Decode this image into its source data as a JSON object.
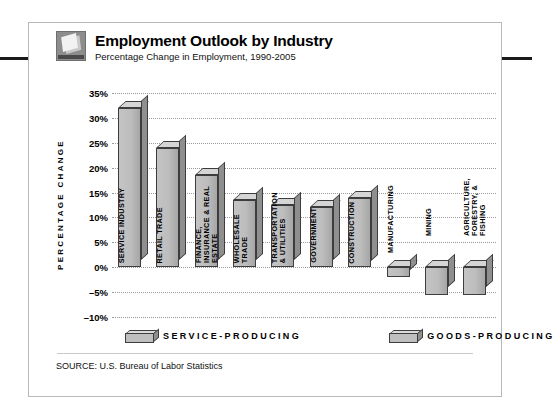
{
  "header": {
    "title": "Employment Outlook by Industry",
    "subtitle": "Percentage Change in Employment, 1990-2005",
    "logo_icon": "cube-box-icon"
  },
  "legend": {
    "items": [
      {
        "label": "SERVICE-PRODUCING",
        "color": "#bfbfbf"
      },
      {
        "label": "GOODS-PRODUCING",
        "color": "#bfbfbf"
      }
    ]
  },
  "source": "SOURCE: U.S. Bureau of Labor Statistics",
  "chart_data": {
    "type": "bar",
    "title": "Employment Outlook by Industry",
    "subtitle": "Percentage Change in Employment, 1990-2005",
    "xlabel": "",
    "ylabel": "PERCENTAGE CHANGE",
    "ylim": [
      -10,
      35
    ],
    "ytick_labels": [
      "35%",
      "30%",
      "25%",
      "20%",
      "15%",
      "10%",
      "5%",
      "0%",
      "–5%",
      "–10%"
    ],
    "yticks": [
      35,
      30,
      25,
      20,
      15,
      10,
      5,
      0,
      -5,
      -10
    ],
    "grid": true,
    "legend_position": "bottom",
    "categories": [
      "SERVICE INDUSTRY",
      "RETAIL TRADE",
      "FINANCE, INSURANCE & REAL ESTATE",
      "WHOLESALE TRADE",
      "TRANSPORTATION & UTILITIES",
      "GOVERNMENT",
      "CONSTRUCTION",
      "MANUFACTURING",
      "MINING",
      "AGRICULTURE, FORESTRY, & FISHING"
    ],
    "values": [
      32,
      24,
      18.5,
      13.5,
      12.5,
      12,
      14,
      -2,
      -5.5,
      -5.5
    ],
    "groups": [
      "SERVICE-PRODUCING",
      "SERVICE-PRODUCING",
      "SERVICE-PRODUCING",
      "SERVICE-PRODUCING",
      "SERVICE-PRODUCING",
      "SERVICE-PRODUCING",
      "GOODS-PRODUCING",
      "GOODS-PRODUCING",
      "GOODS-PRODUCING",
      "GOODS-PRODUCING"
    ]
  }
}
